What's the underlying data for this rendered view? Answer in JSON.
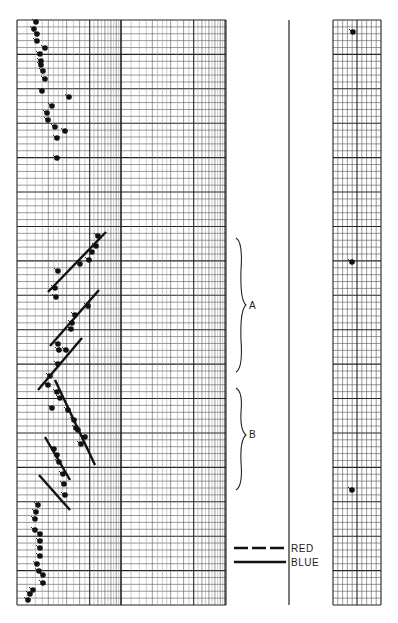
{
  "chart_data": {
    "type": "scatter",
    "title": "",
    "xlabel": "",
    "ylabel": "",
    "grid": true,
    "x_scale": "log",
    "panels": [
      {
        "name": "main-log-chart",
        "x_range_px": [
          17,
          226
        ],
        "y_range_px": [
          20,
          605
        ]
      },
      {
        "name": "right-strip-chart",
        "x_range_px": [
          333,
          381
        ],
        "y_range_px": [
          20,
          605
        ]
      }
    ],
    "annotations": [
      {
        "label": "A",
        "type": "brace",
        "y_range_px": [
          238,
          372
        ]
      },
      {
        "label": "B",
        "type": "brace",
        "y_range_px": [
          388,
          490
        ]
      }
    ],
    "legend": [
      {
        "label": "RED",
        "style": "dashed"
      },
      {
        "label": "BLUE",
        "style": "solid"
      }
    ],
    "series": [
      {
        "name": "top-cluster",
        "points": [
          [
            36,
            22
          ],
          [
            34,
            29
          ],
          [
            37,
            34
          ],
          [
            37,
            41
          ],
          [
            45,
            48
          ],
          [
            40,
            54
          ],
          [
            41,
            61
          ],
          [
            41,
            65
          ],
          [
            43,
            71
          ],
          [
            45,
            79
          ],
          [
            42,
            91
          ],
          [
            69,
            97
          ],
          [
            52,
            106
          ],
          [
            47,
            113
          ],
          [
            48,
            120
          ],
          [
            55,
            127
          ],
          [
            65,
            131
          ],
          [
            57,
            138
          ],
          [
            57,
            158
          ]
        ]
      },
      {
        "name": "segment-1-points",
        "points": [
          [
            98,
            236
          ],
          [
            96,
            246
          ],
          [
            92,
            252
          ],
          [
            89,
            260
          ],
          [
            80,
            264
          ],
          [
            58,
            271
          ],
          [
            55,
            288
          ],
          [
            56,
            297
          ]
        ]
      },
      {
        "name": "segment-2-points",
        "points": [
          [
            88,
            306
          ],
          [
            75,
            315
          ],
          [
            72,
            323
          ],
          [
            71,
            329
          ],
          [
            58,
            344
          ],
          [
            59,
            350
          ]
        ]
      },
      {
        "name": "segment-3-points",
        "points": [
          [
            66,
            350
          ],
          [
            58,
            364
          ],
          [
            50,
            376
          ],
          [
            48,
            385
          ]
        ]
      },
      {
        "name": "segment-4-points",
        "points": [
          [
            57,
            392
          ],
          [
            60,
            398
          ],
          [
            52,
            408
          ],
          [
            68,
            410
          ],
          [
            74,
            420
          ],
          [
            76,
            428
          ],
          [
            78,
            430
          ],
          [
            85,
            437
          ],
          [
            81,
            444
          ]
        ]
      },
      {
        "name": "segment-5-points",
        "points": [
          [
            54,
            449
          ],
          [
            57,
            455
          ],
          [
            59,
            462
          ],
          [
            63,
            474
          ],
          [
            64,
            484
          ],
          [
            65,
            495
          ]
        ]
      },
      {
        "name": "bottom-cluster",
        "points": [
          [
            38,
            505
          ],
          [
            36,
            512
          ],
          [
            35,
            519
          ],
          [
            35,
            530
          ],
          [
            40,
            534
          ],
          [
            40,
            541
          ],
          [
            40,
            548
          ],
          [
            40,
            556
          ],
          [
            37,
            564
          ],
          [
            39,
            571
          ],
          [
            43,
            575
          ],
          [
            43,
            583
          ],
          [
            33,
            590
          ],
          [
            30,
            594
          ],
          [
            28,
            600
          ]
        ]
      },
      {
        "name": "right-strip-points",
        "points": [
          [
            353,
            32
          ],
          [
            352,
            262
          ],
          [
            352,
            490
          ]
        ]
      }
    ],
    "fit_lines": [
      {
        "style": "solid",
        "from": [
          48,
          292
        ],
        "to": [
          106,
          232
        ]
      },
      {
        "style": "solid",
        "from": [
          50,
          346
        ],
        "to": [
          99,
          290
        ]
      },
      {
        "style": "solid",
        "from": [
          38,
          390
        ],
        "to": [
          82,
          338
        ]
      },
      {
        "style": "solid",
        "from": [
          55,
          380
        ],
        "to": [
          95,
          465
        ]
      },
      {
        "style": "solid",
        "from": [
          45,
          437
        ],
        "to": [
          70,
          480
        ]
      },
      {
        "style": "solid",
        "from": [
          39,
          475
        ],
        "to": [
          70,
          510
        ]
      }
    ]
  },
  "legend": {
    "red_label": "RED",
    "blue_label": "BLUE"
  },
  "annotations": {
    "a_label": "A",
    "b_label": "B"
  },
  "colors": {
    "grid_major": "#222222",
    "grid_minor": "#555555",
    "ink": "#111111",
    "background": "#ffffff"
  }
}
